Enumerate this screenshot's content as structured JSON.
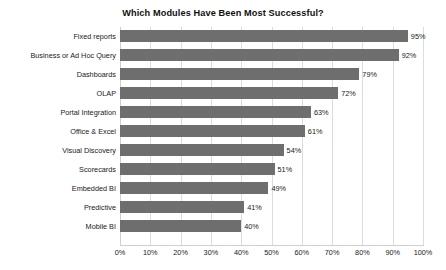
{
  "chart_data": {
    "type": "bar",
    "orientation": "horizontal",
    "title": "Which Modules Have Been Most Successful?",
    "xlabel": "",
    "ylabel": "",
    "xlim": [
      0,
      100
    ],
    "xticks": [
      0,
      10,
      20,
      30,
      40,
      50,
      60,
      70,
      80,
      90,
      100
    ],
    "xtick_labels": [
      "0%",
      "10%",
      "20%",
      "30%",
      "40%",
      "50%",
      "60%",
      "70%",
      "80%",
      "90%",
      "100%"
    ],
    "grid": true,
    "legend": false,
    "bar_color": "#6e6e6e",
    "grid_color": "#dcdcdc",
    "background_color": "#ffffff",
    "value_suffix": "%",
    "categories": [
      "Fixed reports",
      "Business or Ad Hoc Query",
      "Dashboards",
      "OLAP",
      "Portal Integration",
      "Office & Excel",
      "Visual Discovery",
      "Scorecards",
      "Embedded BI",
      "Predictive",
      "Mobile BI"
    ],
    "values": [
      95,
      92,
      79,
      72,
      63,
      61,
      54,
      51,
      49,
      41,
      40
    ],
    "data_labels": [
      "95%",
      "92%",
      "79%",
      "72%",
      "63%",
      "61%",
      "54%",
      "51%",
      "49%",
      "41%",
      "40%"
    ]
  }
}
